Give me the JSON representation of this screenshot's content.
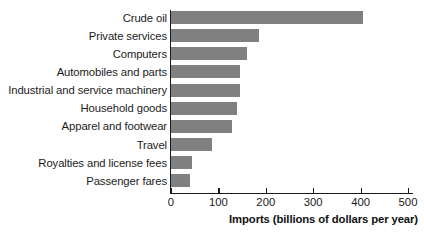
{
  "chart_data": {
    "type": "bar",
    "orientation": "horizontal",
    "title": "",
    "xlabel": "Imports (billions of dollars per year)",
    "ylabel": "",
    "xlim": [
      0,
      510
    ],
    "xticks": [
      0,
      100,
      200,
      300,
      400,
      500
    ],
    "xtick_labels": [
      "0",
      "100",
      "200",
      "300",
      "400",
      "500"
    ],
    "grid": false,
    "legend": null,
    "bar_color": "#808080",
    "axis_color": "#1a1a1a",
    "categories": [
      "Crude oil",
      "Private services",
      "Computers",
      "Automobiles and parts",
      "Industrial and service machinery",
      "Household goods",
      "Apparel and footwear",
      "Travel",
      "Royalties and license fees",
      "Passenger fares"
    ],
    "values": [
      405,
      185,
      160,
      146,
      145,
      140,
      128,
      86,
      44,
      40
    ]
  }
}
